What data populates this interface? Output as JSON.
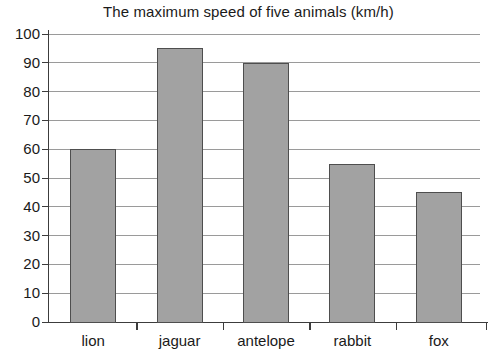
{
  "chart_data": {
    "type": "bar",
    "title": "The maximum speed of five animals (km/h)",
    "xlabel": "",
    "ylabel": "",
    "categories": [
      "lion",
      "jaguar",
      "antelope",
      "rabbit",
      "fox"
    ],
    "values": [
      60,
      95,
      90,
      55,
      45
    ],
    "ylim": [
      0,
      100
    ],
    "ytick_step": 10,
    "yticks": [
      "0",
      "10",
      "20",
      "30",
      "40",
      "50",
      "60",
      "70",
      "80",
      "90",
      "100"
    ],
    "grid": true,
    "legend": false,
    "bar_fill_color": "#a2a2a2",
    "bar_border_color": "#4e4e4e",
    "gridline_color": "#9a9a9a",
    "axis_color": "#3c3c3c",
    "background_color": "#ffffff",
    "text_color": "#1a1a1a"
  }
}
